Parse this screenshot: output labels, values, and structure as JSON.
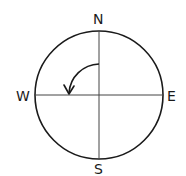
{
  "diagram": {
    "type": "compass",
    "directions": {
      "north": "N",
      "south": "S",
      "east": "E",
      "west": "W"
    },
    "rotation_arrow": {
      "direction": "counter-clockwise",
      "from": "north",
      "to": "west",
      "angle_degrees": 90
    },
    "colors": {
      "stroke": "#1a1a1a",
      "axis": "#444444",
      "background": "#ffffff"
    }
  }
}
